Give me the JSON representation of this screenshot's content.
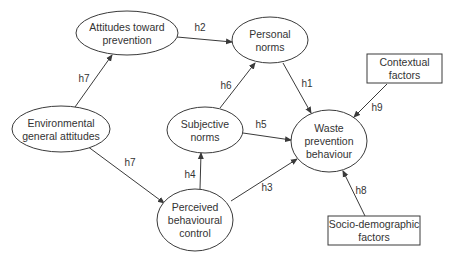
{
  "diagram": {
    "title_fragment": "",
    "nodes": {
      "attitudes": {
        "lines": [
          "Attitudes toward",
          "prevention"
        ],
        "shape": "ellipse",
        "cx": 127,
        "cy": 33,
        "rx": 51,
        "ry": 22
      },
      "personal_norms": {
        "lines": [
          "Personal",
          "norms"
        ],
        "shape": "ellipse",
        "cx": 270,
        "cy": 40,
        "rx": 38,
        "ry": 23
      },
      "environmental": {
        "lines": [
          "Environmental",
          "general attitudes"
        ],
        "shape": "ellipse",
        "cx": 61,
        "cy": 129,
        "rx": 49,
        "ry": 23
      },
      "subjective_norms": {
        "lines": [
          "Subjective",
          "norms"
        ],
        "shape": "ellipse",
        "cx": 205,
        "cy": 130,
        "rx": 38,
        "ry": 23
      },
      "waste_prevention": {
        "lines": [
          "Waste",
          "prevention",
          "behaviour"
        ],
        "shape": "ellipse",
        "cx": 329,
        "cy": 141,
        "rx": 38,
        "ry": 31
      },
      "perceived_control": {
        "lines": [
          "Perceived",
          "behavioural",
          "control"
        ],
        "shape": "ellipse",
        "cx": 195,
        "cy": 220,
        "rx": 38,
        "ry": 31
      },
      "contextual": {
        "lines": [
          "Contextual",
          "factors"
        ],
        "shape": "rect",
        "x": 367,
        "y": 54,
        "w": 75,
        "h": 29
      },
      "socio_demographic": {
        "lines": [
          "Socio-demographic",
          "factors"
        ],
        "shape": "rect",
        "x": 328,
        "y": 216,
        "w": 92,
        "h": 29
      }
    },
    "edges": [
      {
        "id": "h2",
        "label": "h2",
        "from": "attitudes",
        "to": "personal_norms",
        "x1": 177,
        "y1": 37,
        "x2": 232,
        "y2": 42,
        "lx": 200,
        "ly": 31
      },
      {
        "id": "h7a",
        "label": "h7",
        "from": "environmental",
        "to": "attitudes",
        "x1": 75,
        "y1": 107,
        "x2": 112,
        "y2": 55,
        "lx": 84,
        "ly": 82
      },
      {
        "id": "h7b",
        "label": "h7",
        "from": "environmental",
        "to": "perceived_control",
        "x1": 87,
        "y1": 146,
        "x2": 164,
        "y2": 203,
        "lx": 130,
        "ly": 166
      },
      {
        "id": "h6",
        "label": "h6",
        "from": "subjective_norms",
        "to": "personal_norms",
        "x1": 220,
        "y1": 108,
        "x2": 255,
        "y2": 63,
        "lx": 226,
        "ly": 89
      },
      {
        "id": "h1",
        "label": "h1",
        "from": "personal_norms",
        "to": "waste_prevention",
        "x1": 283,
        "y1": 63,
        "x2": 311,
        "y2": 113,
        "lx": 307,
        "ly": 87
      },
      {
        "id": "h5",
        "label": "h5",
        "from": "subjective_norms",
        "to": "waste_prevention",
        "x1": 243,
        "y1": 133,
        "x2": 291,
        "y2": 140,
        "lx": 261,
        "ly": 128
      },
      {
        "id": "h4",
        "label": "h4",
        "from": "perceived_control",
        "to": "subjective_norms",
        "x1": 200,
        "y1": 189,
        "x2": 201,
        "y2": 153,
        "lx": 190,
        "ly": 178
      },
      {
        "id": "h3",
        "label": "h3",
        "from": "perceived_control",
        "to": "waste_prevention",
        "x1": 231,
        "y1": 201,
        "x2": 297,
        "y2": 159,
        "lx": 267,
        "ly": 191
      },
      {
        "id": "h9",
        "label": "h9",
        "from": "contextual",
        "to": "waste_prevention",
        "x1": 387,
        "y1": 84,
        "x2": 354,
        "y2": 117,
        "lx": 377,
        "ly": 111
      },
      {
        "id": "h8",
        "label": "h8",
        "from": "socio_demographic",
        "to": "waste_prevention",
        "x1": 365,
        "y1": 216,
        "x2": 343,
        "y2": 171,
        "lx": 361,
        "ly": 194
      }
    ],
    "colors": {
      "stroke": "#3a3a3a",
      "text": "#333333",
      "background": "#ffffff"
    }
  }
}
